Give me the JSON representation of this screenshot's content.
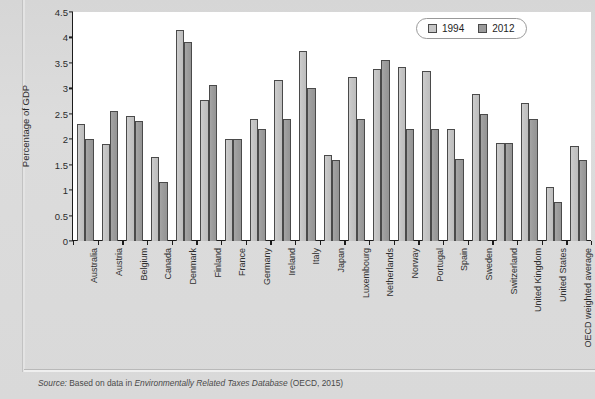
{
  "figure": {
    "title_cropped": "",
    "source_prefix": "Source:",
    "source_text_a": " Based on data in ",
    "source_italic": "Environmentally Related Taxes Database",
    "source_text_b": " (OECD, 2015)"
  },
  "legend": {
    "items": [
      {
        "label": "1994",
        "color": "#c6c6c6"
      },
      {
        "label": "2012",
        "color": "#9b9b9b"
      }
    ]
  },
  "axis": {
    "y_label": "Percentage of GDP",
    "y_ticks": [
      "0",
      "0.5",
      "1",
      "1.5",
      "2",
      "2.5",
      "3",
      "3.5",
      "4",
      "4.5"
    ]
  },
  "chart_data": {
    "type": "bar",
    "title": "",
    "xlabel": "",
    "ylabel": "Percentage of GDP",
    "ylim": [
      0,
      4.5
    ],
    "ytick_step": 0.5,
    "grid": false,
    "legend_position": "top-right",
    "categories": [
      "Australia",
      "Austria",
      "Belgium",
      "Canada",
      "Denmark",
      "Finland",
      "France",
      "Germany",
      "Ireland",
      "Italy",
      "Japan",
      "Luxembourg",
      "Netherlands",
      "Norway",
      "Portugal",
      "Spain",
      "Sweden",
      "Switzerland",
      "United Kingdom",
      "United States",
      "OECD weighted average"
    ],
    "series": [
      {
        "name": "1994",
        "color": "#c6c6c6",
        "values": [
          2.3,
          1.9,
          2.45,
          1.66,
          4.14,
          2.78,
          2.0,
          2.4,
          3.16,
          3.74,
          1.69,
          3.23,
          3.38,
          3.42,
          3.34,
          2.2,
          2.88,
          1.92,
          2.71,
          1.07,
          1.86
        ]
      },
      {
        "name": "2012",
        "color": "#9b9b9b",
        "values": [
          2.0,
          2.56,
          2.35,
          1.16,
          3.92,
          3.07,
          2.0,
          2.2,
          2.4,
          3.0,
          1.6,
          2.4,
          3.56,
          2.2,
          2.2,
          1.62,
          2.5,
          1.92,
          2.4,
          0.77,
          1.6
        ]
      }
    ]
  }
}
